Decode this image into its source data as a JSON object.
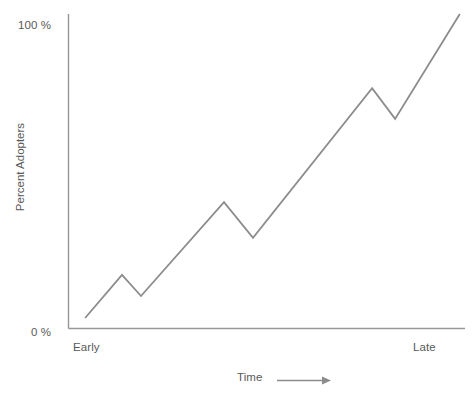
{
  "chart_data": {
    "type": "line",
    "title": "",
    "subtitle": "",
    "xlabel": "Time",
    "ylabel": "Percent Adopters",
    "xlim": [
      0,
      100
    ],
    "ylim": [
      0,
      100
    ],
    "grid": false,
    "legend": null,
    "x_tick_labels": [
      "Early",
      "Late"
    ],
    "y_tick_labels": [
      "0 %",
      "100 %"
    ],
    "x_axis_arrow": true,
    "series": [
      {
        "name": "Percent Adopters",
        "color": "#8c8c8c",
        "x": [
          4.3,
          13.6,
          18.4,
          39.3,
          46.6,
          76.6,
          82.4,
          98.7
        ],
        "values": [
          3.2,
          16.9,
          10.2,
          40.1,
          28.7,
          76.4,
          66.6,
          100.0
        ]
      }
    ],
    "annotations": []
  },
  "axis": {
    "y_top_label": "100 %",
    "y_bottom_label": "0 %",
    "x_left_label": "Early",
    "x_right_label": "Late",
    "y_title": "Percent Adopters",
    "x_title": "Time"
  },
  "colors": {
    "line": "#8c8c8c",
    "axis": "#969696",
    "text": "#595959",
    "background": "#ffffff"
  },
  "icons": {
    "x_axis_arrow": "arrow-right-icon"
  }
}
